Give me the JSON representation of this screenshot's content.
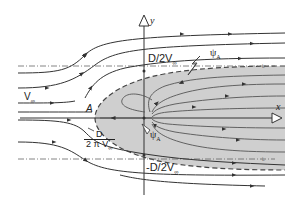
{
  "axes": {
    "x_label": "x",
    "y_label": "y"
  },
  "labels": {
    "freestream": "V",
    "freestream_sub": "∞",
    "stagnation_point": "A",
    "upper_asymptote": "D/2V",
    "upper_asymptote_sub": "∞",
    "lower_asymptote": "-D/2V",
    "lower_asymptote_sub": "∞",
    "stagnation_offset_num": "D",
    "stagnation_offset_den": "2 π V",
    "stagnation_offset_den_sub": "∞",
    "psi_a_upper": "ψ",
    "psi_a_upper_sub": "A",
    "psi_a_lower": "ψ",
    "psi_a_lower_sub": "A"
  },
  "colors": {
    "stroke": "#333333",
    "body_fill": "#cfcfcf",
    "dashed": "#555555",
    "background": "#ffffff"
  }
}
